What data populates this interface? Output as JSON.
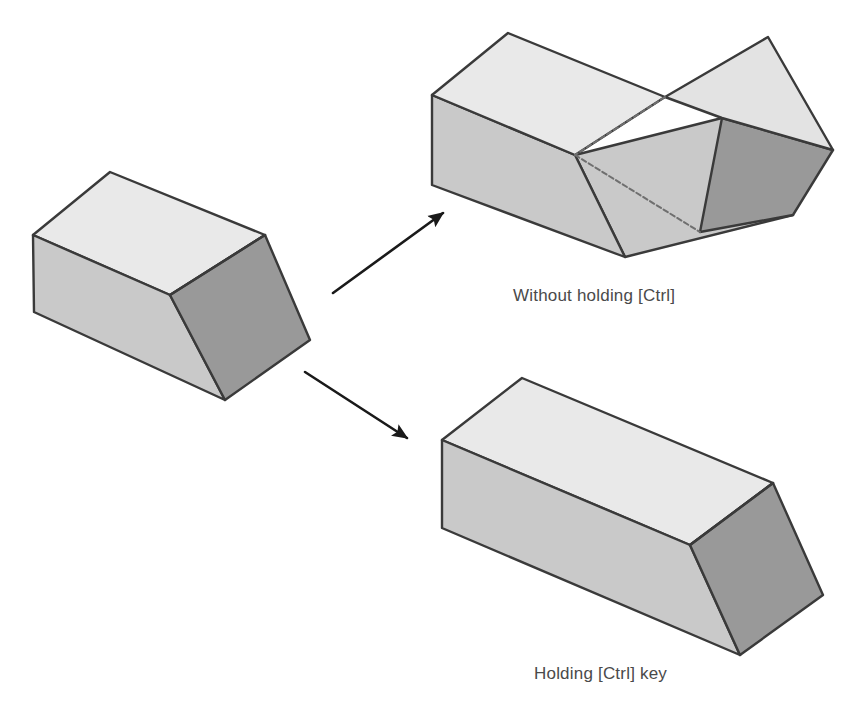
{
  "figure": {
    "background_color": "#ffffff",
    "width": 863,
    "height": 719
  },
  "palette": {
    "face_top": "#e9e9e9",
    "face_top_alt": "#e3e3e3",
    "face_side": "#c9c9c9",
    "face_side_dark": "#bdbdbd",
    "face_end": "#999999",
    "edge": "#3a3a3a",
    "edge_soft": "#6f6f6f",
    "arrow": "#1a1a1a",
    "caption_text": "#4a4a4a"
  },
  "captions": {
    "without_ctrl": "Without holding [Ctrl]",
    "holding_ctrl": "Holding [Ctrl] key"
  },
  "shapes": {
    "source": {
      "name": "source-wedge-solid",
      "label": "",
      "faces": {
        "top": "110,172 265,235 170,295 33,235",
        "side": "33,235 170,295 225,400 34,312",
        "end": "170,295 265,235 310,340 225,400"
      }
    },
    "result_without_ctrl": {
      "name": "bent-chevron-solid",
      "label": "Without holding [Ctrl]",
      "faces": {
        "top_left": "508,33 665,97 575,155 432,95",
        "top_right": "665,97 768,37 833,150 722,118",
        "side_left": "432,95 575,155 625,257 432,185",
        "side_right": "575,155 722,118 793,215 625,257",
        "end": "722,118 833,150 793,215 700,232"
      },
      "crease": "665,97 575,155"
    },
    "result_holding_ctrl": {
      "name": "elongated-wedge-solid",
      "label": "Holding [Ctrl] key",
      "faces": {
        "top": "522,378 773,483 690,545 442,440",
        "side": "442,440 690,545 740,655 442,528",
        "end": "690,545 773,483 823,595 740,655"
      }
    }
  },
  "arrows": [
    {
      "name": "arrow-to-without-ctrl",
      "from": [
        333,
        293
      ],
      "to": [
        447,
        210
      ],
      "target": "Without holding [Ctrl]"
    },
    {
      "name": "arrow-to-holding-ctrl",
      "from": [
        305,
        372
      ],
      "to": [
        412,
        441
      ],
      "target": "Holding [Ctrl] key"
    }
  ]
}
